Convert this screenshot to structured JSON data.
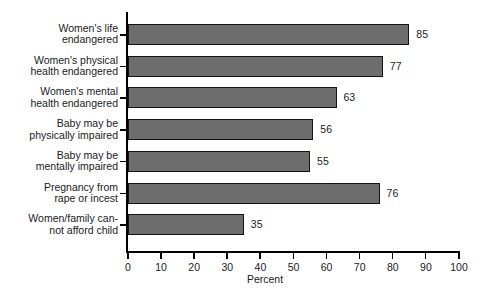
{
  "chart_data": {
    "type": "bar",
    "orientation": "horizontal",
    "title": "",
    "xlabel": "Percent",
    "ylabel": "",
    "xlim": [
      0,
      100
    ],
    "xticks": [
      0,
      10,
      20,
      30,
      40,
      50,
      60,
      70,
      80,
      90,
      100
    ],
    "grid": false,
    "legend": null,
    "bar_color": "#6d6d6d",
    "bar_border_color": "#141414",
    "axis_color": "#000000",
    "categories": [
      "Women's life\nendangered",
      "Women's physical\nhealth endangered",
      "Women's mental\nhealth endangered",
      "Baby may be\nphysically impaired",
      "Baby may be\nmentally impaired",
      "Pregnancy from\nrape or incest",
      "Women/family can-\nnot afford child"
    ],
    "values": [
      85,
      77,
      63,
      56,
      55,
      76,
      35
    ],
    "value_labels": [
      "85",
      "77",
      "63",
      "56",
      "55",
      "76",
      "35"
    ]
  }
}
